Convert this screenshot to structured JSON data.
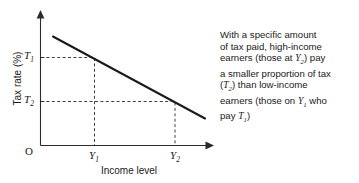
{
  "chart_data": {
    "type": "line",
    "title": "",
    "xlabel": "Income level",
    "ylabel": "Tax rate (%)",
    "origin_label": "O",
    "grid": false,
    "legend": "none",
    "xlim": [
      0,
      1
    ],
    "ylim": [
      0,
      1
    ],
    "series": [
      {
        "name": "Regressive tax rate",
        "x": [
          0.075,
          0.945
        ],
        "y": [
          0.815,
          0.207
        ],
        "style": "solid-descending-straight-line"
      }
    ],
    "x_ticks": [
      {
        "label": "Y1",
        "label_text": "Y",
        "subscript": "1",
        "x": 0.31
      },
      {
        "label": "Y2",
        "label_text": "Y",
        "subscript": "2",
        "x": 0.772
      }
    ],
    "y_ticks": [
      {
        "label": "T1",
        "label_text": "T",
        "subscript": "1",
        "y": 0.662
      },
      {
        "label": "T2",
        "label_text": "T",
        "subscript": "2",
        "y": 0.331
      }
    ],
    "annotations": [
      {
        "from": "T1",
        "to": "Y1",
        "style": "dashed",
        "note": "tax rate T1 corresponds to income level Y1"
      },
      {
        "from": "T2",
        "to": "Y2",
        "style": "dashed",
        "note": "tax rate T2 corresponds to income level Y2"
      }
    ]
  },
  "axes": {
    "y_label": "Tax rate (%)",
    "x_label": "Income level",
    "origin": "O"
  },
  "tick_labels": {
    "t1": {
      "base": "T",
      "sub": "1"
    },
    "t2": {
      "base": "T",
      "sub": "2"
    },
    "y1": {
      "base": "Y",
      "sub": "1"
    },
    "y2": {
      "base": "Y",
      "sub": "2"
    }
  },
  "annotation": {
    "full_text": "With a specific amount of tax paid, high-income earners (those at Y2) pay a smaller proportion of tax (T2) than low-income earners (those on Y1 who pay T1)",
    "lines": [
      {
        "id": "line1",
        "parts": [
          {
            "t": "With a specific amount"
          }
        ]
      },
      {
        "id": "line2",
        "parts": [
          {
            "t": "of tax paid, high-income"
          }
        ]
      },
      {
        "id": "line3",
        "parts": [
          {
            "t": "earners (those at "
          },
          {
            "t": "Y",
            "sub": "2",
            "var": true
          },
          {
            "t": ") pay"
          }
        ]
      },
      {
        "id": "line4",
        "parts": [
          {
            "t": "a smaller proportion of tax"
          }
        ]
      },
      {
        "id": "line5",
        "parts": [
          {
            "t": "("
          },
          {
            "t": "T",
            "sub": "2",
            "var": true
          },
          {
            "t": ") than low-income"
          }
        ]
      },
      {
        "id": "line6",
        "parts": [
          {
            "t": "earners (those on "
          },
          {
            "t": "Y",
            "sub": "1",
            "var": true
          },
          {
            "t": " who"
          }
        ]
      },
      {
        "id": "line7",
        "parts": [
          {
            "t": "pay "
          },
          {
            "t": "T",
            "sub": "1",
            "var": true
          },
          {
            "t": ")"
          }
        ]
      }
    ]
  },
  "colors": {
    "background": "#ffffff",
    "axis": "#2b2b2b",
    "curve": "#1a1a1a",
    "guide": "#2b2b2b",
    "text": "#1a1a1a"
  }
}
